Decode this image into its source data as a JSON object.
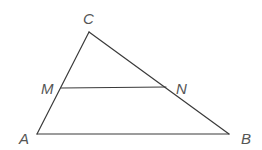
{
  "diagram": {
    "type": "triangle-with-midsegment",
    "points": {
      "A": {
        "label": "A",
        "x": 37,
        "y": 134,
        "label_x": 19,
        "label_y": 144
      },
      "B": {
        "label": "B",
        "x": 229,
        "y": 134,
        "label_x": 241,
        "label_y": 144
      },
      "C": {
        "label": "C",
        "x": 89,
        "y": 32,
        "label_x": 83,
        "label_y": 24
      },
      "M": {
        "label": "M",
        "x": 61,
        "y": 88,
        "label_x": 41,
        "label_y": 94
      },
      "N": {
        "label": "N",
        "x": 166,
        "y": 87,
        "label_x": 176,
        "label_y": 94
      }
    },
    "segments": [
      {
        "name": "segment-ac",
        "from": "A",
        "to": "C"
      },
      {
        "name": "segment-cb",
        "from": "C",
        "to": "B"
      },
      {
        "name": "segment-ab",
        "from": "A",
        "to": "B"
      },
      {
        "name": "segment-mn",
        "from": "M",
        "to": "N"
      }
    ],
    "colors": {
      "line": "#3a3a3a",
      "label": "#555555",
      "background": "#ffffff"
    }
  }
}
